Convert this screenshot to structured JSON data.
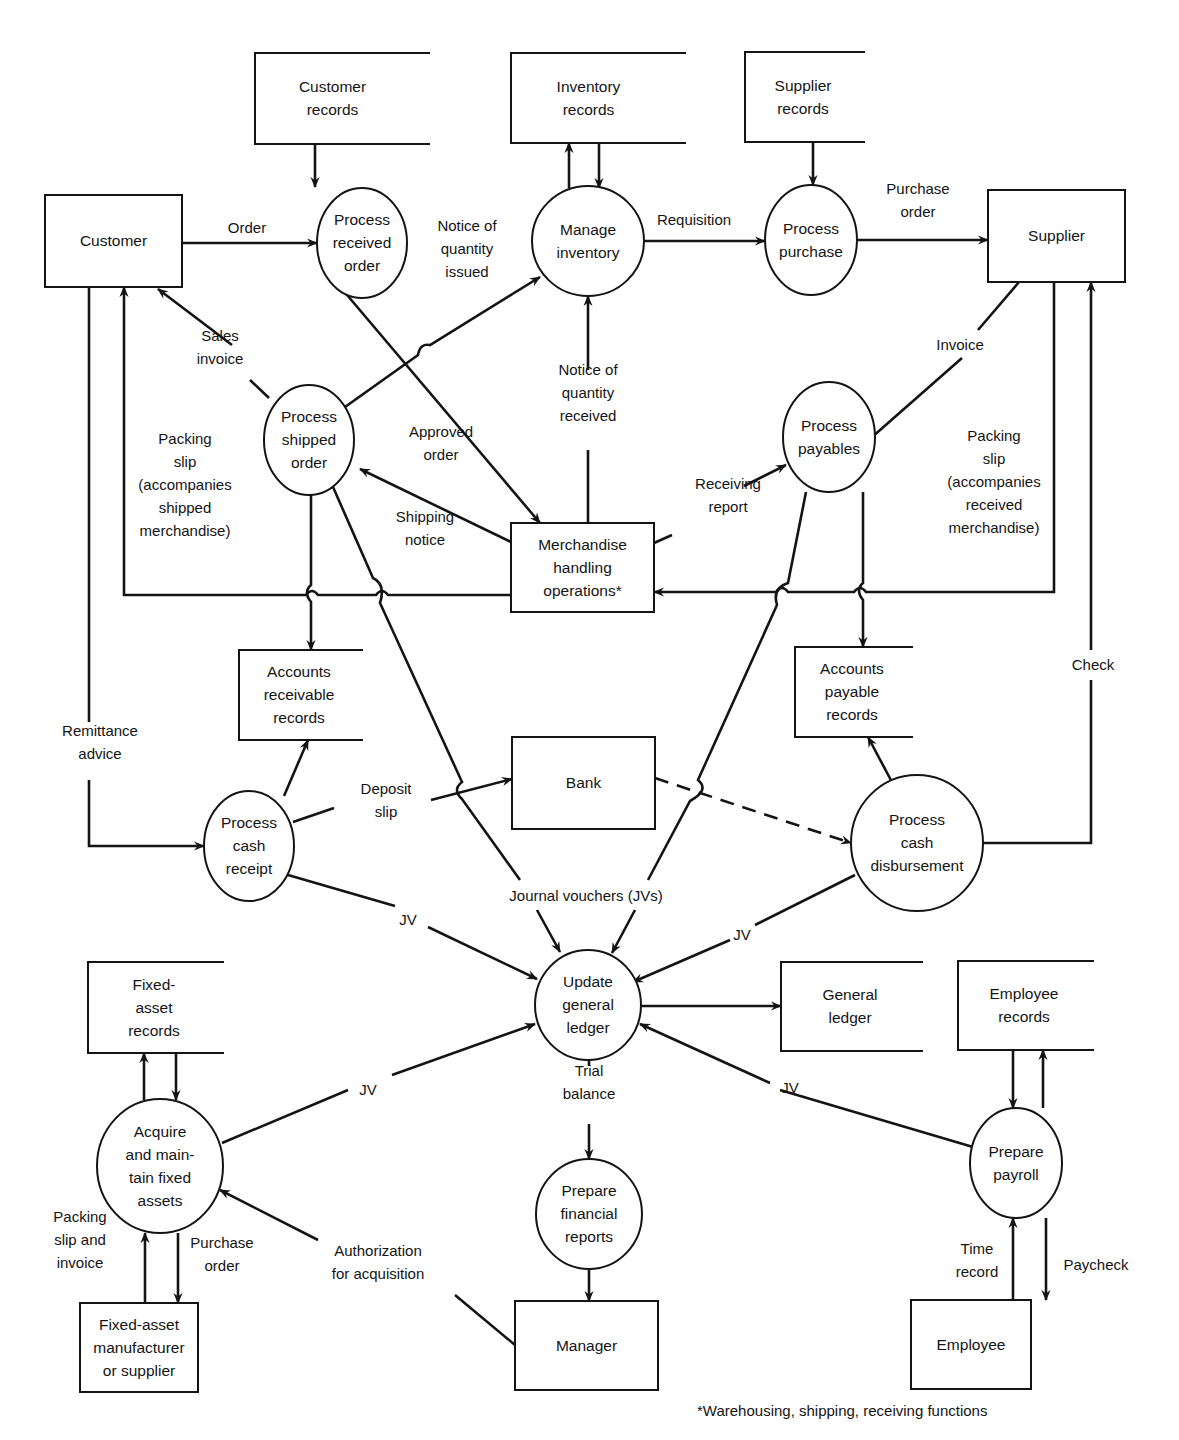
{
  "diagram": {
    "type": "data-flow-diagram",
    "colors": {
      "ink": "#141414",
      "background": "#ffffff"
    },
    "nodes": [
      {
        "id": "customer",
        "kind": "entity",
        "label": [
          "Customer"
        ],
        "x": 45,
        "y": 195,
        "w": 137,
        "h": 92
      },
      {
        "id": "customer_records",
        "kind": "store",
        "label": [
          "Customer",
          "records"
        ],
        "x": 255,
        "y": 53,
        "w": 175,
        "h": 91
      },
      {
        "id": "inventory_records",
        "kind": "store",
        "label": [
          "Inventory",
          "records"
        ],
        "x": 511,
        "y": 53,
        "w": 175,
        "h": 90
      },
      {
        "id": "supplier_records",
        "kind": "store",
        "label": [
          "Supplier",
          "records"
        ],
        "x": 745,
        "y": 52,
        "w": 120,
        "h": 90
      },
      {
        "id": "supplier",
        "kind": "entity",
        "label": [
          "Supplier"
        ],
        "x": 988,
        "y": 190,
        "w": 137,
        "h": 92
      },
      {
        "id": "process_received_order",
        "kind": "process",
        "label": [
          "Process",
          "received",
          "order"
        ],
        "cx": 362,
        "cy": 243,
        "rx": 45,
        "ry": 55
      },
      {
        "id": "manage_inventory",
        "kind": "process",
        "label": [
          "Manage",
          "inventory"
        ],
        "cx": 588,
        "cy": 241,
        "rx": 56,
        "ry": 55
      },
      {
        "id": "process_purchase",
        "kind": "process",
        "label": [
          "Process",
          "purchase"
        ],
        "cx": 811,
        "cy": 240,
        "rx": 46,
        "ry": 55
      },
      {
        "id": "process_shipped_order",
        "kind": "process",
        "label": [
          "Process",
          "shipped",
          "order"
        ],
        "cx": 309,
        "cy": 440,
        "rx": 45,
        "ry": 55
      },
      {
        "id": "process_payables",
        "kind": "process",
        "label": [
          "Process",
          "payables"
        ],
        "cx": 829,
        "cy": 437,
        "rx": 46,
        "ry": 55
      },
      {
        "id": "merchandise_handling",
        "kind": "entity",
        "label": [
          "Merchandise",
          "handling",
          "operations*"
        ],
        "x": 511,
        "y": 523,
        "w": 143,
        "h": 89
      },
      {
        "id": "ar_records",
        "kind": "store",
        "label": [
          "Accounts",
          "receivable",
          "records"
        ],
        "x": 239,
        "y": 650,
        "w": 124,
        "h": 90
      },
      {
        "id": "ap_records",
        "kind": "store",
        "label": [
          "Accounts",
          "payable",
          "records"
        ],
        "x": 795,
        "y": 647,
        "w": 118,
        "h": 90
      },
      {
        "id": "bank",
        "kind": "entity",
        "label": [
          "Bank"
        ],
        "x": 512,
        "y": 737,
        "w": 143,
        "h": 92
      },
      {
        "id": "process_cash_receipt",
        "kind": "process",
        "label": [
          "Process",
          "cash",
          "receipt"
        ],
        "cx": 249,
        "cy": 846,
        "rx": 45,
        "ry": 55
      },
      {
        "id": "process_cash_disbursement",
        "kind": "process",
        "label": [
          "Process",
          "cash",
          "disbursement"
        ],
        "cx": 917,
        "cy": 843,
        "rx": 66,
        "ry": 68
      },
      {
        "id": "update_general_ledger",
        "kind": "process",
        "label": [
          "Update",
          "general",
          "ledger"
        ],
        "cx": 588,
        "cy": 1005,
        "rx": 53,
        "ry": 55
      },
      {
        "id": "fixed_asset_records",
        "kind": "store",
        "label": [
          "Fixed-",
          "asset",
          "records"
        ],
        "x": 88,
        "y": 962,
        "w": 136,
        "h": 91
      },
      {
        "id": "general_ledger",
        "kind": "store",
        "label": [
          "General",
          "ledger"
        ],
        "x": 781,
        "y": 962,
        "w": 142,
        "h": 89
      },
      {
        "id": "employee_records",
        "kind": "store",
        "label": [
          "Employee",
          "records"
        ],
        "x": 958,
        "y": 961,
        "w": 136,
        "h": 89
      },
      {
        "id": "acquire_fixed_assets",
        "kind": "process",
        "label": [
          "Acquire",
          "and main-",
          "tain fixed",
          "assets"
        ],
        "cx": 160,
        "cy": 1166,
        "rx": 63,
        "ry": 67
      },
      {
        "id": "prepare_financial_reports",
        "kind": "process",
        "label": [
          "Prepare",
          "financial",
          "reports"
        ],
        "cx": 589,
        "cy": 1214,
        "rx": 53,
        "ry": 55
      },
      {
        "id": "prepare_payroll",
        "kind": "process",
        "label": [
          "Prepare",
          "payroll"
        ],
        "cx": 1016,
        "cy": 1163,
        "rx": 46,
        "ry": 55
      },
      {
        "id": "fixed_asset_supplier",
        "kind": "entity",
        "label": [
          "Fixed-asset",
          "manufacturer",
          "or supplier"
        ],
        "x": 80,
        "y": 1303,
        "w": 118,
        "h": 89
      },
      {
        "id": "manager",
        "kind": "entity",
        "label": [
          "Manager"
        ],
        "x": 515,
        "y": 1301,
        "w": 143,
        "h": 89
      },
      {
        "id": "employee",
        "kind": "entity",
        "label": [
          "Employee"
        ],
        "x": 911,
        "y": 1300,
        "w": 120,
        "h": 89
      }
    ],
    "flows": [
      {
        "id": "order",
        "from": "customer",
        "to": "process_received_order",
        "label": [
          "Order"
        ],
        "lx": 247,
        "ly": 228,
        "path": "M182,243 L317,243",
        "arrow": "end"
      },
      {
        "id": "customer_records_read",
        "from": "customer_records",
        "to": "process_received_order",
        "label": [],
        "path": "M315,144 L315,187",
        "arrow": "end"
      },
      {
        "id": "approved_order",
        "from": "process_received_order",
        "to": "merchandise_handling",
        "label": [
          "Approved",
          "order"
        ],
        "lx": 441,
        "ly": 443,
        "path": "M342,289 L540,523",
        "arrow": "end"
      },
      {
        "id": "inventory_write",
        "from": "manage_inventory",
        "to": "inventory_records",
        "label": [],
        "path": "M569,188 L569,143",
        "arrow": "end"
      },
      {
        "id": "inventory_read",
        "from": "inventory_records",
        "to": "manage_inventory",
        "label": [],
        "path": "M599,143 L599,188",
        "arrow": "end"
      },
      {
        "id": "requisition",
        "from": "manage_inventory",
        "to": "process_purchase",
        "label": [
          "Requisition"
        ],
        "lx": 694,
        "ly": 220,
        "path": "M644,241 L765,241",
        "arrow": "end"
      },
      {
        "id": "supplier_records_read",
        "from": "supplier_records",
        "to": "process_purchase",
        "label": [],
        "path": "M813,142 L813,185",
        "arrow": "end"
      },
      {
        "id": "purchase_order",
        "from": "process_purchase",
        "to": "supplier",
        "label": [
          "Purchase",
          "order"
        ],
        "lx": 918,
        "ly": 200,
        "path": "M857,240 L988,240",
        "arrow": "end"
      },
      {
        "id": "notice_qty_issued",
        "from": "process_shipped_order",
        "to": "manage_inventory",
        "label": [
          "Notice of",
          "quantity",
          "issued"
        ],
        "lx": 467,
        "ly": 249,
        "path": "M345,407 L418,355 Q420,343 430,345 L540,277",
        "arrow": "end"
      },
      {
        "id": "sales_invoice",
        "from": "process_shipped_order",
        "to": "customer",
        "label": [
          "Sales",
          "invoice"
        ],
        "lx": 220,
        "ly": 347,
        "path": "M269,398 L250,380 M232,345 L158,289",
        "arrow": "end"
      },
      {
        "id": "notice_qty_received",
        "from": "merchandise_handling",
        "to": "manage_inventory",
        "label": [
          "Notice of",
          "quantity",
          "received"
        ],
        "lx": 588,
        "ly": 393,
        "path": "M588,523 L588,450 M588,370 L588,296",
        "arrow": "end"
      },
      {
        "id": "shipping_notice",
        "from": "merchandise_handling",
        "to": "process_shipped_order",
        "label": [
          "Shipping",
          "notice"
        ],
        "lx": 425,
        "ly": 528,
        "path": "M511,542 L360,469",
        "arrow": "end"
      },
      {
        "id": "receiving_report",
        "from": "merchandise_handling",
        "to": "process_payables",
        "label": [
          "Receiving",
          "report"
        ],
        "lx": 728,
        "ly": 495,
        "path": "M654,543 L672,535 M744,486 L786,465",
        "arrow": "end"
      },
      {
        "id": "invoice",
        "from": "supplier",
        "to": "process_payables",
        "label": [
          "Invoice"
        ],
        "lx": 960,
        "ly": 345,
        "path": "M1019,282 L978,330 M962,358 L863,445",
        "arrow": "end"
      },
      {
        "id": "packing_slip_shipped",
        "from": "merchandise_handling",
        "to": "customer",
        "label": [
          "Packing",
          "slip",
          "(accompanies",
          "shipped",
          "merchandise)"
        ],
        "lx": 185,
        "ly": 485,
        "path": "M511,595 L388,595 Q382,587 376,595 L318,595 Q312,587 306,595 L124,595 L124,287",
        "arrow": "end"
      },
      {
        "id": "packing_slip_received",
        "from": "supplier",
        "to": "merchandise_handling",
        "label": [
          "Packing",
          "slip",
          "(accompanies",
          "received",
          "merchandise)"
        ],
        "lx": 994,
        "ly": 482,
        "path": "M1054,282 L1054,592 L866,592 Q860,584 854,592 L788,592 Q782,584 776,592 L654,592",
        "arrow": "end"
      },
      {
        "id": "shipped_to_ar",
        "from": "process_shipped_order",
        "to": "ar_records",
        "label": [],
        "path": "M311,495 L311,585 Q303,592 311,602 L311,650",
        "arrow": "end"
      },
      {
        "id": "shipped_to_gl_jv",
        "from": "process_shipped_order",
        "to": "update_general_ledger",
        "label": [],
        "path": "M333,487 L373,578 Q386,584 380,603 L462,782 Q452,790 462,799 L520,880 M537,910 L560,952",
        "arrow": "end"
      },
      {
        "id": "payables_to_ap",
        "from": "process_payables",
        "to": "ap_records",
        "label": [],
        "path": "M863,492 L863,583 Q855,590 863,600 L863,647",
        "arrow": "end"
      },
      {
        "id": "payables_to_gl_jv",
        "from": "process_payables",
        "to": "update_general_ledger",
        "label": [],
        "path": "M806,492 L788,583 Q772,588 777,605 L698,780 Q710,790 690,801 L648,880 M635,910 L612,953",
        "arrow": "end"
      },
      {
        "id": "remittance_advice",
        "from": "customer",
        "to": "process_cash_receipt",
        "label": [
          "Remittance",
          "advice"
        ],
        "lx": 100,
        "ly": 742,
        "path": "M89,287 L89,722 M89,780 L89,846 L204,846",
        "arrow": "end"
      },
      {
        "id": "check",
        "from": "process_cash_disbursement",
        "to": "supplier",
        "label": [
          "Check"
        ],
        "lx": 1093,
        "ly": 665,
        "path": "M983,843 L1091,843 L1091,680 M1091,650 L1091,282",
        "arrow": "end"
      },
      {
        "id": "cash_receipt_to_ar",
        "from": "process_cash_receipt",
        "to": "ar_records",
        "label": [],
        "path": "M284,796 L308,740",
        "arrow": "end"
      },
      {
        "id": "deposit_slip",
        "from": "process_cash_receipt",
        "to": "bank",
        "label": [
          "Deposit",
          "slip"
        ],
        "lx": 386,
        "ly": 800,
        "path": "M293,822 L334,808 M431,800 L512,779",
        "arrow": "end"
      },
      {
        "id": "bank_to_disbursement",
        "from": "bank",
        "to": "process_cash_disbursement",
        "label": [],
        "path": "M655,778 L851,843",
        "arrow": "end",
        "dashed": true
      },
      {
        "id": "cash_disbursement_to_ap",
        "from": "process_cash_disbursement",
        "to": "ap_records",
        "label": [],
        "path": "M893,784 L868,737",
        "arrow": "end"
      },
      {
        "id": "jv_cash_receipt",
        "from": "process_cash_receipt",
        "to": "update_general_ledger",
        "label": [
          "JV"
        ],
        "lx": 408,
        "ly": 920,
        "path": "M288,875 L395,906 M428,927 L537,979",
        "arrow": "end"
      },
      {
        "id": "jv_cash_disbursement",
        "from": "process_cash_disbursement",
        "to": "update_general_ledger",
        "label": [
          "JV"
        ],
        "lx": 742,
        "ly": 935,
        "path": "M855,875 L755,925 M730,940 L633,982",
        "arrow": "end"
      },
      {
        "id": "gl_to_general_ledger",
        "from": "update_general_ledger",
        "to": "general_ledger",
        "label": [],
        "path": "M641,1006 L781,1006",
        "arrow": "end"
      },
      {
        "id": "trial_balance",
        "from": "update_general_ledger",
        "to": "prepare_financial_reports",
        "label": [
          "Trial",
          "balance"
        ],
        "lx": 589,
        "ly": 1082,
        "path": "M589,1060 L589,1066 M589,1124 L589,1159",
        "arrow": "end"
      },
      {
        "id": "financial_reports_to_manager",
        "from": "prepare_financial_reports",
        "to": "manager",
        "label": [],
        "path": "M589,1269 L589,1301",
        "arrow": "end"
      },
      {
        "id": "jv_fixed_assets",
        "from": "acquire_fixed_assets",
        "to": "update_general_ledger",
        "label": [
          "JV"
        ],
        "lx": 368,
        "ly": 1090,
        "path": "M222,1143 L348,1090 M392,1075 L535,1024",
        "arrow": "end"
      },
      {
        "id": "fa_write",
        "from": "acquire_fixed_assets",
        "to": "fixed_asset_records",
        "label": [],
        "path": "M144,1100 L144,1053",
        "arrow": "end"
      },
      {
        "id": "fa_read",
        "from": "fixed_asset_records",
        "to": "acquire_fixed_assets",
        "label": [],
        "path": "M176,1053 L176,1100",
        "arrow": "end"
      },
      {
        "id": "packing_slip_invoice",
        "from": "fixed_asset_supplier",
        "to": "acquire_fixed_assets",
        "label": [
          "Packing",
          "slip and",
          "invoice"
        ],
        "lx": 80,
        "ly": 1240,
        "path": "M145,1303 L145,1233",
        "arrow": "end"
      },
      {
        "id": "fa_purchase_order",
        "from": "acquire_fixed_assets",
        "to": "fixed_asset_supplier",
        "label": [
          "Purchase",
          "order"
        ],
        "lx": 222,
        "ly": 1254,
        "path": "M178,1233 L178,1303",
        "arrow": "end"
      },
      {
        "id": "authorization",
        "from": "manager",
        "to": "acquire_fixed_assets",
        "label": [
          "Authorization",
          "for acquisition"
        ],
        "lx": 378,
        "ly": 1262,
        "path": "M515,1345 L455,1295 M318,1240 L220,1190",
        "arrow": "end"
      },
      {
        "id": "jv_payroll",
        "from": "prepare_payroll",
        "to": "update_general_ledger",
        "label": [
          "JV"
        ],
        "lx": 790,
        "ly": 1088,
        "path": "M973,1147 L780,1090 M770,1083 L640,1024",
        "arrow": "end"
      },
      {
        "id": "payroll_read",
        "from": "employee_records",
        "to": "prepare_payroll",
        "label": [],
        "path": "M1013,1050 L1013,1108",
        "arrow": "end"
      },
      {
        "id": "payroll_write",
        "from": "prepare_payroll",
        "to": "employee_records",
        "label": [],
        "path": "M1043,1108 L1043,1050",
        "arrow": "end"
      },
      {
        "id": "time_record",
        "from": "employee",
        "to": "prepare_payroll",
        "label": [
          "Time",
          "record"
        ],
        "lx": 977,
        "ly": 1260,
        "path": "M1013,1300 L1013,1218",
        "arrow": "end"
      },
      {
        "id": "paycheck",
        "from": "prepare_payroll",
        "to": "employee",
        "label": [
          "Paycheck"
        ],
        "lx": 1096,
        "ly": 1265,
        "path": "M1046,1218 L1046,1300",
        "arrow": "end"
      },
      {
        "id": "journal_vouchers_label",
        "from": "",
        "to": "",
        "label": [
          "Journal vouchers (JVs)"
        ],
        "lx": 586,
        "ly": 896,
        "path": "",
        "arrow": "none"
      }
    ]
  },
  "footnote": "*Warehousing, shipping, receiving functions"
}
